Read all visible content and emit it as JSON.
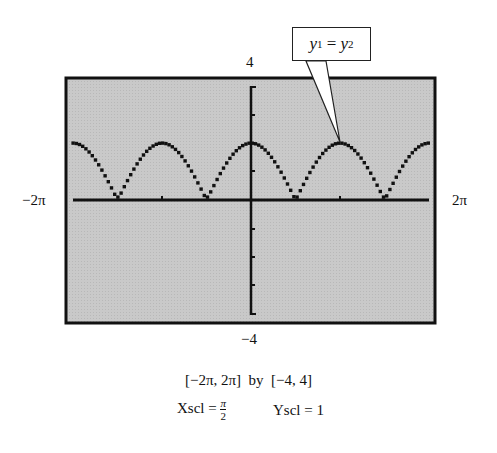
{
  "chart_data": {
    "type": "line",
    "title": "",
    "function_description": "y1 = y2, graph resembling y = |2 cos x|",
    "x_range": [
      "-2π",
      "2π"
    ],
    "y_range": [
      -4,
      4
    ],
    "xscl": "π/2",
    "yscl": 1,
    "xlabel_left": "−2π",
    "xlabel_right": "2π",
    "ylabel_top": "4",
    "ylabel_bottom": "−4",
    "series": [
      {
        "name": "y1 = y2",
        "x": [
          "-2π",
          "-3π/2",
          "-π",
          "-π/2",
          "0",
          "π/2",
          "π",
          "3π/2",
          "2π"
        ],
        "values": [
          2,
          0,
          2,
          0,
          2,
          0,
          2,
          0,
          2
        ]
      }
    ],
    "annotation": "y1 = y2",
    "grid": false,
    "background": "#c8c8c8"
  },
  "labels": {
    "y_top": "4",
    "y_bottom": "−4",
    "x_left": "−2π",
    "x_right": "2π"
  },
  "callout": {
    "y_var": "y",
    "sub1": "1",
    "eq": " = ",
    "sub2": "2"
  },
  "window": {
    "line": "[−2π, 2π]  by  [−4, 4]",
    "xscl_label": "Xscl = ",
    "xscl_num": "π",
    "xscl_den": "2",
    "yscl_label": "Yscl = 1"
  }
}
